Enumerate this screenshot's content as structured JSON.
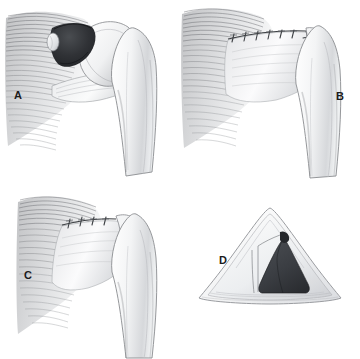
{
  "figure": {
    "style": "grayscale medical line illustration",
    "background_color": "#ffffff",
    "panel_count": 4
  },
  "panels": [
    {
      "id": "A",
      "label": "A",
      "name": "panel-a-tear",
      "description": "Lateral view of shoulder showing full-thickness rotator cuff tear with dark triangular defect at the tendon insertion on the greater tuberosity",
      "features": [
        "deltoid/cuff muscle fibers",
        "dark tear defect",
        "bone fragment highlight",
        "humeral head",
        "greater tuberosity",
        "humeral shaft"
      ],
      "defect_color": "#2b2d30"
    },
    {
      "id": "B",
      "label": "B",
      "name": "panel-b-repair-long",
      "description": "Repaired cuff with long horizontal running suture line extending to the tuberosity and continuing vertically along the bone",
      "features": [
        "horizontal suture line",
        "vertical suture limb",
        "approximated tendon edges",
        "humeral head",
        "humeral shaft"
      ],
      "suture_stitches": 6,
      "suture_color": "#3d4044"
    },
    {
      "id": "C",
      "label": "C",
      "name": "panel-c-repair-short",
      "description": "Alternate repair with a shorter horizontal suture line; tendon advanced and fixed to the bone",
      "features": [
        "short horizontal suture line",
        "approximated tendon edges",
        "humeral head",
        "humeral shaft"
      ],
      "suture_stitches": 4,
      "suture_color": "#3d4044"
    },
    {
      "id": "D",
      "label": "D",
      "name": "panel-d-cross-section",
      "description": "Cross-sectional tent-shaped schematic showing the closed repair with dark triangular interior cavity",
      "features": [
        "outer triangular tented outline",
        "inner layer outline",
        "dark triangular cavity",
        "flap margin"
      ],
      "cavity_color": "#3a3d42"
    }
  ],
  "colors": {
    "background": "#ffffff",
    "ink_dark": "#1b1b1b",
    "ink_mid": "#77797d",
    "ink_light": "#c7c9cc",
    "bone_fill": "#fbfbfc",
    "bone_shade": "#d9dbde",
    "defect_dark": "#2b2d30",
    "cavity_dark": "#3a3d42",
    "suture": "#3d4044"
  }
}
